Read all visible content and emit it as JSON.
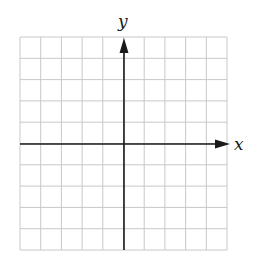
{
  "diagram": {
    "type": "coordinate-grid",
    "axes": {
      "x_label": "x",
      "y_label": "y"
    },
    "grid": {
      "columns": 10,
      "rows": 10,
      "origin_column": 5,
      "origin_row": 5
    },
    "colors": {
      "grid": "#c8c8c8",
      "axis": "#1a1a1a",
      "background": "#ffffff"
    }
  }
}
